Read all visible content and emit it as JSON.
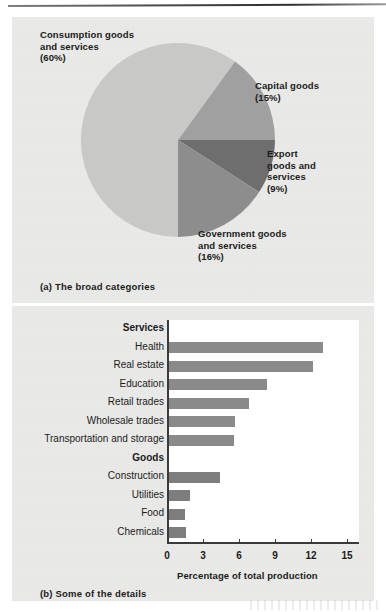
{
  "figure": {
    "panel_a_caption": "(a) The broad categories",
    "panel_b_caption": "(b) Some of the details"
  },
  "chart_data": [
    {
      "type": "pie",
      "title": "(a) The broad categories",
      "labels": [
        "Consumption goods and services",
        "Capital goods",
        "Export goods and services",
        "Government goods and services"
      ],
      "values": [
        60,
        15,
        9,
        16
      ],
      "unit": "%",
      "legend": "inline-callouts",
      "slice_colors": [
        "#c8c8c6",
        "#a0a0a0",
        "#6e6e6e",
        "#8d8d8d"
      ],
      "annotations": [
        {
          "name": "consumption",
          "text": "Consumption goods\nand services\n(60%)",
          "value": 60
        },
        {
          "name": "capital",
          "text": "Capital goods\n(15%)",
          "value": 15
        },
        {
          "name": "export",
          "text": "Export\ngoods and\nservices\n(9%)",
          "value": 9
        },
        {
          "name": "government",
          "text": "Government goods\nand services\n(16%)",
          "value": 16
        }
      ]
    },
    {
      "type": "bar",
      "orientation": "horizontal",
      "title": "(b) Some of the details",
      "xlabel": "Percentage of total production",
      "ylabel": "",
      "xlim": [
        0,
        16
      ],
      "xticks": [
        0,
        3,
        6,
        9,
        12,
        15
      ],
      "xticklabels": [
        "0",
        "3",
        "6",
        "9",
        "12",
        "15"
      ],
      "grid": false,
      "group_headers": [
        "Services",
        "Goods"
      ],
      "categories": [
        "Health",
        "Real estate",
        "Education",
        "Retail trades",
        "Wholesale trades",
        "Transportation and storage",
        "Construction",
        "Utilities",
        "Food",
        "Chemicals"
      ],
      "values": [
        13.0,
        12.2,
        8.3,
        6.8,
        5.7,
        5.6,
        4.4,
        1.9,
        1.5,
        1.6
      ],
      "bar_color": "#8a8a8a",
      "rows": [
        {
          "kind": "header",
          "label": "Services"
        },
        {
          "kind": "bar",
          "label": "Health",
          "value": 13.0
        },
        {
          "kind": "bar",
          "label": "Real estate",
          "value": 12.2
        },
        {
          "kind": "bar",
          "label": "Education",
          "value": 8.3
        },
        {
          "kind": "bar",
          "label": "Retail trades",
          "value": 6.8
        },
        {
          "kind": "bar",
          "label": "Wholesale trades",
          "value": 5.7
        },
        {
          "kind": "bar",
          "label": "Transportation and storage",
          "value": 5.6
        },
        {
          "kind": "header",
          "label": "Goods"
        },
        {
          "kind": "bar",
          "label": "Construction",
          "value": 4.4
        },
        {
          "kind": "bar",
          "label": "Utilities",
          "value": 1.9
        },
        {
          "kind": "bar",
          "label": "Food",
          "value": 1.5
        },
        {
          "kind": "bar",
          "label": "Chemicals",
          "value": 1.6
        }
      ]
    }
  ]
}
